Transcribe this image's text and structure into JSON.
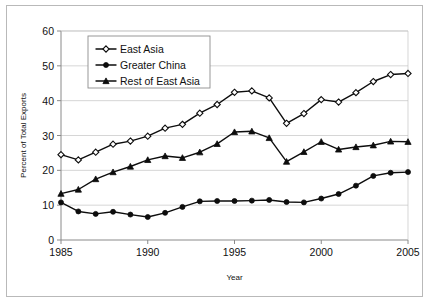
{
  "chart_data": {
    "type": "line",
    "title": "",
    "xlabel": "Year",
    "ylabel": "Percent of Total Exports",
    "xlim": [
      1985,
      2005
    ],
    "ylim": [
      0,
      60
    ],
    "ytick_step": 10,
    "xtick_step": 5,
    "grid": true,
    "legend_position": "upper-left-inside",
    "x": [
      1985,
      1986,
      1987,
      1988,
      1989,
      1990,
      1991,
      1992,
      1993,
      1994,
      1995,
      1996,
      1997,
      1998,
      1999,
      2000,
      2001,
      2002,
      2003,
      2004,
      2005
    ],
    "xticks": [
      "1985",
      "1990",
      "1995",
      "2000",
      "2005"
    ],
    "yticks": [
      "0",
      "10",
      "20",
      "30",
      "40",
      "50",
      "60"
    ],
    "series": [
      {
        "name": "East Asia",
        "marker": "open-diamond",
        "values": [
          24.5,
          23.0,
          25.2,
          27.5,
          28.4,
          29.8,
          32.1,
          33.2,
          36.4,
          38.9,
          42.4,
          42.8,
          40.8,
          33.5,
          36.3,
          40.3,
          39.6,
          42.3,
          45.5,
          47.5,
          47.8
        ]
      },
      {
        "name": "Greater China",
        "marker": "filled-circle",
        "values": [
          10.8,
          8.2,
          7.5,
          8.1,
          7.3,
          6.6,
          7.8,
          9.5,
          11.1,
          11.2,
          11.2,
          11.3,
          11.5,
          10.9,
          10.8,
          11.9,
          13.2,
          15.6,
          18.4,
          19.3,
          19.5
        ]
      },
      {
        "name": "Rest of East Asia",
        "marker": "filled-triangle",
        "values": [
          13.3,
          14.5,
          17.5,
          19.5,
          21.1,
          23.0,
          24.1,
          23.6,
          25.2,
          27.6,
          31.0,
          31.2,
          29.3,
          22.5,
          25.3,
          28.2,
          26.0,
          26.7,
          27.2,
          28.3,
          28.2
        ]
      }
    ]
  },
  "legend": {
    "entries": [
      {
        "label": "East Asia"
      },
      {
        "label": "Greater China"
      },
      {
        "label": "Rest of East Asia"
      }
    ]
  },
  "colors": {
    "line": "#0d0d0d",
    "grid": "#c4c4c4",
    "axis": "#8a8a8a",
    "background": "#ffffff",
    "frame": "#b9b9b9"
  }
}
